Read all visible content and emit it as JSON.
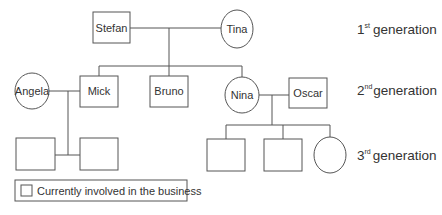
{
  "diagram": {
    "type": "family-tree",
    "generations": [
      {
        "ordinal": "1",
        "suffix": "st",
        "label": "generation"
      },
      {
        "ordinal": "2",
        "suffix": "nd",
        "label": "generation"
      },
      {
        "ordinal": "3",
        "suffix": "rd",
        "label": "generation"
      }
    ],
    "people": {
      "stefan": {
        "name": "Stefan",
        "shape": "square",
        "generation": 1
      },
      "tina": {
        "name": "Tina",
        "shape": "circle",
        "generation": 1
      },
      "angela": {
        "name": "Angela",
        "shape": "circle",
        "generation": 2
      },
      "mick": {
        "name": "Mick",
        "shape": "square",
        "generation": 2
      },
      "bruno": {
        "name": "Bruno",
        "shape": "square",
        "generation": 2
      },
      "nina": {
        "name": "Nina",
        "shape": "circle",
        "generation": 2
      },
      "oscar": {
        "name": "Oscar",
        "shape": "square",
        "generation": 2
      },
      "child1": {
        "name": "",
        "shape": "square",
        "generation": 3
      },
      "child2": {
        "name": "",
        "shape": "square",
        "generation": 3
      },
      "child3": {
        "name": "",
        "shape": "square",
        "generation": 3
      },
      "child4": {
        "name": "",
        "shape": "square",
        "generation": 3
      },
      "child5": {
        "name": "",
        "shape": "circle",
        "generation": 3
      }
    },
    "legend": {
      "label": "Currently involved in the business"
    }
  }
}
